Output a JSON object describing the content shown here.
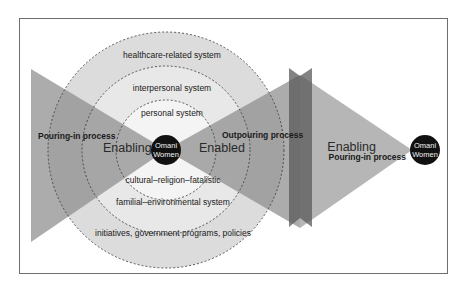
{
  "diagram": {
    "title": "",
    "center_node": {
      "line1": "Omani",
      "line2": "Women"
    },
    "right_node": {
      "line1": "Omani",
      "line2": "Women"
    },
    "systems": [
      {
        "label": "personal system"
      },
      {
        "label": "interpersonal system"
      },
      {
        "label": "healthcare-related system"
      },
      {
        "label": "cultural–religion–fatalistic"
      },
      {
        "label": "familial–environmental system"
      },
      {
        "label": "initiatives, government programs, policies"
      }
    ],
    "left_process": {
      "label": "Pouring-in process",
      "state": "Enabling"
    },
    "middle_process": {
      "label": "Outpouring process",
      "state": "Enabled"
    },
    "right_process": {
      "label": "Pouring-in process",
      "state": "Enabling"
    },
    "colors": {
      "frame": "#6e6e6e",
      "outer_ring": "#d9d9d9",
      "middle_ring": "#e6e6e6",
      "inner_ring": "#f2f2f2",
      "triangle": "#8c8c8c",
      "band": "#5a5a5a",
      "node": "#111111"
    }
  }
}
